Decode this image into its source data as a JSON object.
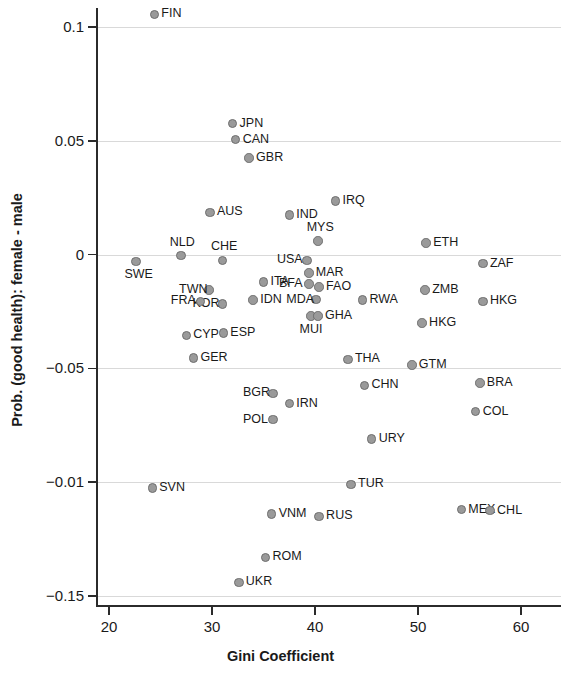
{
  "chart_data": {
    "type": "scatter",
    "title": "",
    "xlabel": "Gini Coefficient",
    "ylabel": "Prob. (good health): female - male",
    "xlim": [
      18,
      61
    ],
    "ylim": [
      -0.155,
      0.112
    ],
    "grid": true,
    "legend": "none",
    "xticks": [
      "20",
      "30",
      "40",
      "50",
      "60"
    ],
    "xtick_values": [
      20,
      30,
      40,
      50,
      60
    ],
    "yticks": [
      "0.1",
      "0.05",
      "0",
      "-0.05",
      "-0.01",
      "-0.15"
    ],
    "ytick_values": [
      0.1,
      0.05,
      0,
      -0.05,
      -0.1,
      -0.15
    ],
    "marker_color": "#9a9a9a",
    "marker_edge_color": "#6e6e6e",
    "points": [
      {
        "label": "FIN",
        "x": 24.4,
        "y": 0.1055,
        "pos": "right"
      },
      {
        "label": "JPN",
        "x": 32.0,
        "y": 0.0575,
        "pos": "right"
      },
      {
        "label": "CAN",
        "x": 32.3,
        "y": 0.0505,
        "pos": "right"
      },
      {
        "label": "GBR",
        "x": 33.6,
        "y": 0.0425,
        "pos": "right"
      },
      {
        "label": "IRQ",
        "x": 42.0,
        "y": 0.0235,
        "pos": "right"
      },
      {
        "label": "AUS",
        "x": 29.8,
        "y": 0.0185,
        "pos": "right"
      },
      {
        "label": "IND",
        "x": 37.5,
        "y": 0.0175,
        "pos": "right"
      },
      {
        "label": "MYS",
        "x": 40.3,
        "y": 0.006,
        "pos": "above"
      },
      {
        "label": "ETH",
        "x": 50.8,
        "y": 0.0052,
        "pos": "right"
      },
      {
        "label": "NLD",
        "x": 27.0,
        "y": -0.0005,
        "pos": "above"
      },
      {
        "label": "CHE",
        "x": 31.0,
        "y": -0.0025,
        "pos": "above"
      },
      {
        "label": "USA",
        "x": 39.2,
        "y": -0.0025,
        "pos": "left"
      },
      {
        "label": "ZAF",
        "x": 56.3,
        "y": -0.004,
        "pos": "right"
      },
      {
        "label": "SWE",
        "x": 22.6,
        "y": -0.003,
        "pos": "below"
      },
      {
        "label": "MAR",
        "x": 39.4,
        "y": -0.008,
        "pos": "right"
      },
      {
        "label": "ITA",
        "x": 35.0,
        "y": -0.012,
        "pos": "right"
      },
      {
        "label": "BFA",
        "x": 39.4,
        "y": -0.013,
        "pos": "left"
      },
      {
        "label": "FAO",
        "x": 40.4,
        "y": -0.0142,
        "pos": "right"
      },
      {
        "label": "ZMB",
        "x": 50.7,
        "y": -0.0155,
        "pos": "right"
      },
      {
        "label": "TWN",
        "x": 29.7,
        "y": -0.0155,
        "pos": "left"
      },
      {
        "label": "MDA",
        "x": 40.1,
        "y": -0.0198,
        "pos": "left"
      },
      {
        "label": "RWA",
        "x": 44.6,
        "y": -0.02,
        "pos": "right"
      },
      {
        "label": "HKG",
        "x": 56.3,
        "y": -0.0205,
        "pos": "right"
      },
      {
        "label": "IDN",
        "x": 34.0,
        "y": -0.02,
        "pos": "right"
      },
      {
        "label": "KOR",
        "x": 31.0,
        "y": -0.0218,
        "pos": "left"
      },
      {
        "label": "FRA",
        "x": 28.9,
        "y": -0.0205,
        "pos": "left"
      },
      {
        "label": "MUI",
        "x": 39.6,
        "y": -0.027,
        "pos": "below"
      },
      {
        "label": "GHA",
        "x": 40.3,
        "y": -0.027,
        "pos": "right"
      },
      {
        "label": "HKG",
        "x": 50.4,
        "y": -0.03,
        "pos": "right"
      },
      {
        "label": "ESP",
        "x": 31.1,
        "y": -0.0345,
        "pos": "right"
      },
      {
        "label": "CYP",
        "x": 27.5,
        "y": -0.0355,
        "pos": "right"
      },
      {
        "label": "GER",
        "x": 28.2,
        "y": -0.0455,
        "pos": "right"
      },
      {
        "label": "THA",
        "x": 43.2,
        "y": -0.046,
        "pos": "right"
      },
      {
        "label": "GTM",
        "x": 49.4,
        "y": -0.0485,
        "pos": "right"
      },
      {
        "label": "BGR",
        "x": 35.9,
        "y": -0.061,
        "pos": "left"
      },
      {
        "label": "CHN",
        "x": 44.8,
        "y": -0.0575,
        "pos": "right"
      },
      {
        "label": "BRA",
        "x": 56.0,
        "y": -0.0565,
        "pos": "right"
      },
      {
        "label": "IRN",
        "x": 37.5,
        "y": -0.0655,
        "pos": "right"
      },
      {
        "label": "POL",
        "x": 35.9,
        "y": -0.0725,
        "pos": "left"
      },
      {
        "label": "COL",
        "x": 55.6,
        "y": -0.069,
        "pos": "right"
      },
      {
        "label": "URY",
        "x": 45.5,
        "y": -0.081,
        "pos": "right"
      },
      {
        "label": "SVN",
        "x": 24.2,
        "y": -0.1025,
        "pos": "right"
      },
      {
        "label": "TUR",
        "x": 43.5,
        "y": -0.101,
        "pos": "right"
      },
      {
        "label": "MEX",
        "x": 54.2,
        "y": -0.112,
        "pos": "right"
      },
      {
        "label": "CHL",
        "x": 57.0,
        "y": -0.1125,
        "pos": "right"
      },
      {
        "label": "VNM",
        "x": 35.8,
        "y": -0.114,
        "pos": "right"
      },
      {
        "label": "RUS",
        "x": 40.4,
        "y": -0.115,
        "pos": "right"
      },
      {
        "label": "ROM",
        "x": 35.2,
        "y": -0.133,
        "pos": "right"
      },
      {
        "label": "UKR",
        "x": 32.6,
        "y": -0.144,
        "pos": "right"
      }
    ]
  }
}
